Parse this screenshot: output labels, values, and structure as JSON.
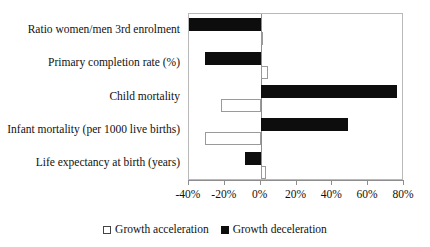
{
  "chart_data": {
    "type": "bar",
    "orientation": "horizontal",
    "title": "",
    "subtitle": "",
    "xlabel": "",
    "ylabel": "",
    "xlim": [
      -40,
      80
    ],
    "xtick_values": [
      -40,
      -20,
      0,
      20,
      40,
      60,
      80
    ],
    "xtick_labels": [
      "-40%",
      "-20%",
      "0%",
      "20%",
      "40%",
      "60%",
      "80%"
    ],
    "grid": false,
    "legend_position": "bottom-center",
    "categories": [
      "Ratio women/men 3rd enrolment",
      "Primary completion rate (%)",
      "Child mortality",
      "Infant mortality (per 1000 live births)",
      "Life expectancy at birth (years)"
    ],
    "series": [
      {
        "name": "Growth acceleration",
        "color": "#ffffff",
        "edge_color": "#9a9a9a",
        "values": [
          1,
          4,
          -22,
          -31,
          3
        ]
      },
      {
        "name": "Growth deceleration",
        "color": "#0d0d0d",
        "edge_color": "#0d0d0d",
        "values": [
          -40,
          -31,
          76,
          49,
          -9
        ]
      }
    ]
  },
  "legend": {
    "items": [
      {
        "label": "Growth acceleration",
        "swatch": "open-square-icon"
      },
      {
        "label": "Growth deceleration",
        "swatch": "filled-square-icon"
      }
    ]
  },
  "colors": {
    "acceleration": "#ffffff",
    "deceleration": "#0d0d0d",
    "axis": "#8d8d8d",
    "plot_border": "#b9b9b9",
    "text": "#111111",
    "background": "#ffffff"
  }
}
